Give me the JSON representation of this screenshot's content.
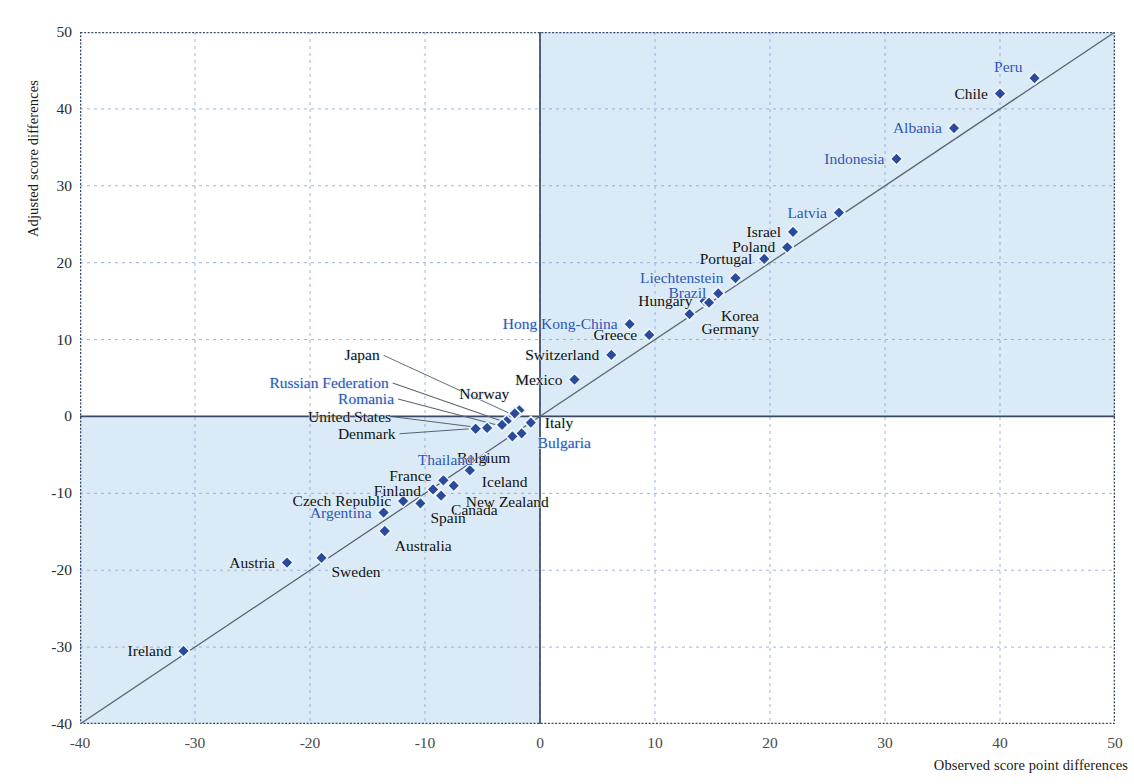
{
  "chart_data": {
    "type": "scatter",
    "title": "",
    "xlabel": "Observed score point differences",
    "ylabel": "Adjusted score differences",
    "xlim": [
      -40,
      50
    ],
    "ylim": [
      -40,
      50
    ],
    "xticks": [
      -40,
      -30,
      -20,
      -10,
      0,
      10,
      20,
      30,
      40,
      50
    ],
    "yticks": [
      -40,
      -30,
      -20,
      -10,
      0,
      10,
      20,
      30,
      40,
      50
    ],
    "grid": true,
    "legend": "none",
    "reference_line": {
      "type": "identity",
      "from": [
        -40,
        -40
      ],
      "to": [
        50,
        50
      ]
    },
    "shaded_quadrants": [
      "x>0 and y>0",
      "x<0 and y<0"
    ],
    "shade_color": "#daeaf6",
    "marker": "diamond",
    "marker_fill": "#2a4a9c",
    "label_color_oecd": "#111111",
    "label_color_partner": "#2d57b8",
    "points": [
      {
        "name": "Peru",
        "x": 43.0,
        "y": 44.0,
        "color": "blue",
        "side": "right",
        "dx": -12,
        "dy": -11
      },
      {
        "name": "Chile",
        "x": 40.0,
        "y": 42.0,
        "color": "black",
        "side": "right",
        "dx": -12,
        "dy": 0
      },
      {
        "name": "Albania",
        "x": 36.0,
        "y": 37.5,
        "color": "blue",
        "side": "right",
        "dx": -12,
        "dy": 0
      },
      {
        "name": "Indonesia",
        "x": 31.0,
        "y": 33.5,
        "color": "blue",
        "side": "right",
        "dx": -12,
        "dy": 0
      },
      {
        "name": "Latvia",
        "x": 26.0,
        "y": 26.5,
        "color": "blue",
        "side": "right",
        "dx": -12,
        "dy": 0
      },
      {
        "name": "Israel",
        "x": 22.0,
        "y": 24.0,
        "color": "black",
        "side": "right",
        "dx": -12,
        "dy": 0
      },
      {
        "name": "Poland",
        "x": 21.5,
        "y": 22.0,
        "color": "black",
        "side": "right",
        "dx": -12,
        "dy": 0
      },
      {
        "name": "Portugal",
        "x": 19.5,
        "y": 20.5,
        "color": "black",
        "side": "right",
        "dx": -12,
        "dy": 0
      },
      {
        "name": "Liechtenstein",
        "x": 17.0,
        "y": 18.0,
        "color": "blue",
        "side": "right",
        "dx": -12,
        "dy": 0
      },
      {
        "name": "Brazil",
        "x": 15.5,
        "y": 16.0,
        "color": "blue",
        "side": "right",
        "dx": -12,
        "dy": 0
      },
      {
        "name": "Hungary",
        "x": 14.3,
        "y": 15.0,
        "color": "black",
        "side": "right",
        "dx": -12,
        "dy": 0
      },
      {
        "name": "Korea",
        "x": 14.7,
        "y": 14.8,
        "color": "black",
        "side": "left",
        "dx": 12,
        "dy": 13
      },
      {
        "name": "Germany",
        "x": 13.0,
        "y": 13.3,
        "color": "black",
        "side": "left",
        "dx": 12,
        "dy": 15
      },
      {
        "name": "Greece",
        "x": 9.5,
        "y": 10.6,
        "color": "black",
        "side": "right",
        "dx": -12,
        "dy": 0
      },
      {
        "name": "Hong Kong-China",
        "x": 7.8,
        "y": 12.0,
        "color": "blue",
        "side": "right",
        "dx": -12,
        "dy": 0
      },
      {
        "name": "Switzerland",
        "x": 6.2,
        "y": 8.0,
        "color": "black",
        "side": "right",
        "dx": -12,
        "dy": 0
      },
      {
        "name": "Mexico",
        "x": 3.0,
        "y": 4.8,
        "color": "black",
        "side": "right",
        "dx": -12,
        "dy": 0
      },
      {
        "name": "Italy",
        "x": -0.8,
        "y": -0.8,
        "color": "black",
        "side": "left",
        "dx": 14,
        "dy": 0
      },
      {
        "name": "Bulgaria",
        "x": -1.6,
        "y": -2.2,
        "color": "blue",
        "side": "left",
        "dx": 16,
        "dy": 10
      },
      {
        "name": "Norway",
        "x": -1.8,
        "y": 0.8,
        "color": "black",
        "side": "right",
        "dx": -10,
        "dy": -16
      },
      {
        "name": "Japan",
        "x": -2.2,
        "y": 0.4,
        "color": "black",
        "side": "right",
        "dx": -135,
        "dy": -58,
        "leader": true
      },
      {
        "name": "Russian Federation",
        "x": -2.9,
        "y": -0.6,
        "color": "blue",
        "side": "right",
        "dx": -118,
        "dy": -38,
        "leader": true
      },
      {
        "name": "Romania",
        "x": -3.3,
        "y": -1.1,
        "color": "blue",
        "side": "right",
        "dx": -108,
        "dy": -26,
        "leader": true
      },
      {
        "name": "United States",
        "x": -4.6,
        "y": -1.5,
        "color": "black",
        "side": "right",
        "dx": -96,
        "dy": -11,
        "leader": true
      },
      {
        "name": "Denmark",
        "x": -5.6,
        "y": -1.6,
        "color": "black",
        "side": "right",
        "dx": -80,
        "dy": 5,
        "leader": true
      },
      {
        "name": "Belgium",
        "x": -2.4,
        "y": -2.6,
        "color": "black",
        "side": "right",
        "dx": -2,
        "dy": 22
      },
      {
        "name": "Thailand",
        "x": -4.8,
        "y": -5.6,
        "color": "blue",
        "side": "right",
        "dx": -12,
        "dy": 0
      },
      {
        "name": "Iceland",
        "x": -6.1,
        "y": -7.0,
        "color": "black",
        "side": "left",
        "dx": 12,
        "dy": 12
      },
      {
        "name": "New Zealand",
        "x": -7.5,
        "y": -9.0,
        "color": "black",
        "side": "left",
        "dx": 12,
        "dy": 16
      },
      {
        "name": "France",
        "x": -8.4,
        "y": -8.3,
        "color": "black",
        "side": "right",
        "dx": -12,
        "dy": -4
      },
      {
        "name": "Finland",
        "x": -9.3,
        "y": -9.5,
        "color": "black",
        "side": "right",
        "dx": -12,
        "dy": 2
      },
      {
        "name": "Canada",
        "x": -8.6,
        "y": -10.3,
        "color": "black",
        "side": "left",
        "dx": 10,
        "dy": 14
      },
      {
        "name": "Spain",
        "x": -10.4,
        "y": -11.3,
        "color": "black",
        "side": "left",
        "dx": 10,
        "dy": 15
      },
      {
        "name": "Czech Republic",
        "x": -11.9,
        "y": -11.0,
        "color": "black",
        "side": "right",
        "dx": -12,
        "dy": 0
      },
      {
        "name": "Argentina",
        "x": -13.6,
        "y": -12.5,
        "color": "blue",
        "side": "right",
        "dx": -12,
        "dy": 0
      },
      {
        "name": "Australia",
        "x": -13.5,
        "y": -14.9,
        "color": "black",
        "side": "left",
        "dx": 10,
        "dy": 15
      },
      {
        "name": "Austria",
        "x": -22.0,
        "y": -19.0,
        "color": "black",
        "side": "right",
        "dx": -12,
        "dy": 0
      },
      {
        "name": "Sweden",
        "x": -19.0,
        "y": -18.4,
        "color": "black",
        "side": "left",
        "dx": 10,
        "dy": 14
      },
      {
        "name": "Ireland",
        "x": -31.0,
        "y": -30.5,
        "color": "black",
        "side": "right",
        "dx": -12,
        "dy": 0
      }
    ]
  }
}
